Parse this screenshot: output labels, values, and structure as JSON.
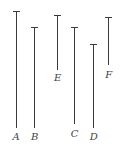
{
  "diagram": {
    "type": "vertical-line-segments",
    "segments": [
      {
        "label": "A",
        "x": 15.5,
        "top": 11,
        "bottom": 128,
        "label_y": 132
      },
      {
        "label": "B",
        "x": 34,
        "top": 27,
        "bottom": 128,
        "label_y": 132
      },
      {
        "label": "E",
        "x": 57,
        "top": 15,
        "bottom": 70,
        "label_y": 73
      },
      {
        "label": "C",
        "x": 74,
        "top": 27,
        "bottom": 124,
        "label_y": 129
      },
      {
        "label": "D",
        "x": 93,
        "top": 44,
        "bottom": 128,
        "label_y": 132
      },
      {
        "label": "F",
        "x": 108,
        "top": 17,
        "bottom": 65,
        "label_y": 70
      }
    ],
    "line_color": "#3a3a3a"
  }
}
